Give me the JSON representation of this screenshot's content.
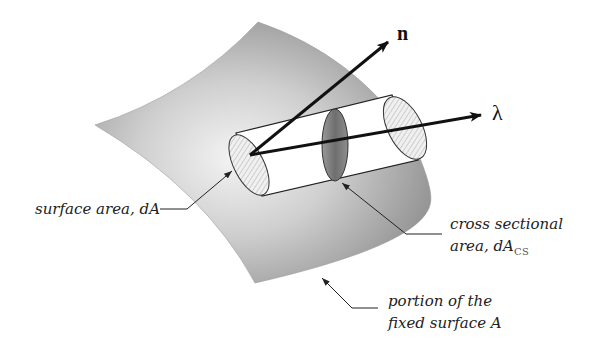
{
  "diagram": {
    "type": "surface-flux-geometry",
    "vectors": [
      {
        "id": "n",
        "label": "n",
        "description": "unit normal vector"
      },
      {
        "id": "lambda",
        "label": "λ",
        "description": "direction vector"
      }
    ],
    "labels": {
      "surface_area": "surface area, dA",
      "cross_section_line1": "cross sectional",
      "cross_section_line2": "area, dA",
      "cross_section_sub": "CS",
      "portion_line1": "portion of the",
      "portion_line2": "fixed surface A"
    },
    "colors": {
      "surface_light": "#f2f2f2",
      "surface_dark": "#8a8a8a",
      "cylinder_fill": "#ffffff",
      "ellipse_hatch": "#d9d9d9",
      "cross_section": "#7a7a7a",
      "ink": "#111111"
    }
  }
}
